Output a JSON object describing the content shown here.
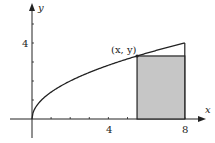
{
  "chart_data": {
    "type": "line",
    "title": "",
    "xlabel": "x",
    "ylabel": "y",
    "x_ticks": [
      1,
      2,
      3,
      4,
      5,
      6,
      7,
      8
    ],
    "x_tick_labels": [
      {
        "value": 4,
        "label": "4"
      },
      {
        "value": 8,
        "label": "8"
      }
    ],
    "y_ticks": [
      1,
      2,
      3,
      4,
      5
    ],
    "y_tick_labels": [
      {
        "value": 4,
        "label": "4"
      }
    ],
    "xlim": [
      0,
      9.2
    ],
    "ylim": [
      0,
      6
    ],
    "grid": false,
    "series": [
      {
        "name": "curve y = sqrt(2x)",
        "x": [
          0,
          0.5,
          1,
          2,
          3,
          4,
          5,
          5.5,
          6,
          7,
          8
        ],
        "values": [
          0,
          1,
          1.414,
          2,
          2.449,
          2.828,
          3.162,
          3.317,
          3.464,
          3.742,
          4
        ]
      }
    ],
    "shapes": [
      {
        "type": "vertical_line",
        "x": 8,
        "y_from": 0,
        "y_to": 4
      },
      {
        "type": "shaded_rectangle",
        "x_from": 5.5,
        "x_to": 8,
        "y_from": 0,
        "y_to": 3.317,
        "fill": "#c6c6c6"
      }
    ],
    "annotations": [
      {
        "text": "(x, y)",
        "x": 5.5,
        "y": 3.317
      }
    ]
  },
  "labels": {
    "x_axis": "x",
    "y_axis": "y",
    "tick_x4": "4",
    "tick_x8": "8",
    "tick_y4": "4",
    "point": "(x, y)"
  },
  "colors": {
    "line": "#222222",
    "rect_fill": "#c6c6c6"
  }
}
